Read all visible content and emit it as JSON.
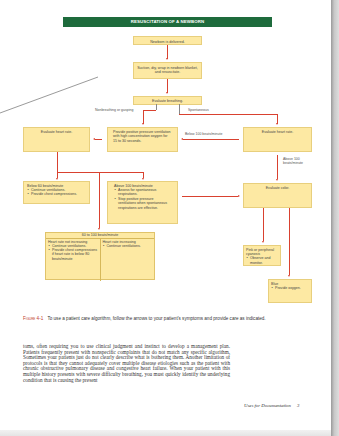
{
  "figure": {
    "title": "RESUSCITATION OF A NEWBORN",
    "nodes": {
      "delivered": "Newborn is delivered.",
      "suction": "Suction, dry, wrap in newborn blanket, and resuscitate.",
      "evaluate_breathing": "Evaluate breathing.",
      "evaluate_hr_left": "Evaluate heart rate.",
      "ppv": "Provide positive pressure ventilation with high concentration oxygen for 15 to 30 seconds.",
      "evaluate_hr_right": "Evaluate heart rate.",
      "below60": {
        "heading": "Below 60 beats/minute",
        "bullets": [
          "Continue ventilations.",
          "Provide chest compressions."
        ]
      },
      "above100": {
        "heading": "Above 100 beats/minute",
        "bullets": [
          "Assess for spontaneous respirations.",
          "Stop positive pressure ventilations when spontaneous respirations are effective."
        ]
      },
      "between60_100": {
        "heading": "60 to 100 beats/minute",
        "left": {
          "heading": "Heart rate not increasing",
          "bullets": [
            "Continue ventilations.",
            "Provide chest compressions if heart rate is below 80 beats/minute"
          ]
        },
        "right": {
          "heading": "Heart rate increasing",
          "bullets": [
            "Continue ventilations."
          ]
        }
      },
      "evaluate_color": "Evaluate color.",
      "pink": {
        "heading": "Pink or peripheral cyanosis",
        "bullets": [
          "Observe and monitor."
        ]
      },
      "blue": {
        "heading": "Blue",
        "bullets": [
          "Provide oxygen."
        ]
      }
    },
    "edge_labels": {
      "nonbreathing": "Nonbreathing or gasping",
      "spontaneous": "Spontaneous",
      "below100": "Below 100 beats/minute",
      "above100_line1": "Above 100",
      "above100_line2": "beats/minute"
    },
    "colors": {
      "title_bar": "#1e6b3c",
      "box_fill": "#fde9a3",
      "arrow": "#d9412f"
    }
  },
  "caption": {
    "label": "Figure 4-1",
    "text": "To use a patient care algorithm, follow the arrows to your patient's symptoms and provide care as indicated."
  },
  "body_text": "toms, often requiring you to use clinical judgment and instinct to develop a management plan. Patients frequently present with nonspecific complaints that do not match any specific algorithm. Sometimes your patients just do not clearly describe what is bothering them. Another limitation of protocols is that they cannot adequately cover multiple disease etiologies such as the patient with chronic obstructive pulmonary disease and congestive heart failure. When your patient with this multiple history presents with severe difficulty breathing, you must quickly identify the underlying condition that is causing the present",
  "footer": {
    "running_title": "Uses for Documentation",
    "page_number": "3"
  }
}
